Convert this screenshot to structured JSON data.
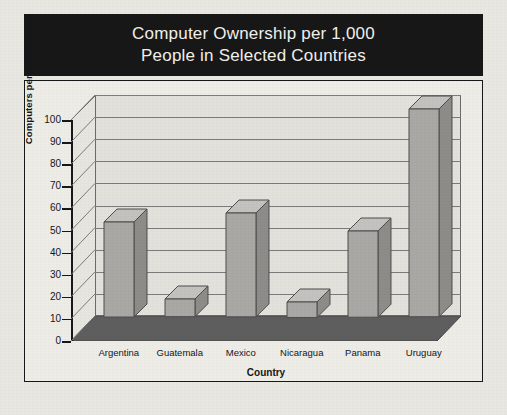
{
  "figure": {
    "title_line1": "Computer Ownership per 1,000",
    "title_line2": "People in Selected Countries",
    "title_bg": "#171717",
    "title_color": "#f2f0ec",
    "panel_bg": "#eeece7",
    "border_color": "#15171a"
  },
  "chart_data": {
    "type": "bar",
    "title": "Computer Ownership per 1,000 People in Selected Countries",
    "categories": [
      "Argentina",
      "Guatemala",
      "Mexico",
      "Nicaragua",
      "Panama",
      "Uruguay"
    ],
    "values": [
      43,
      8,
      47,
      7,
      39,
      94
    ],
    "xlabel": "Country",
    "ylabel": "Computers per 1,000 People",
    "ylim": [
      0,
      100
    ],
    "ytick_step": 10,
    "yticks": [
      100,
      90,
      80,
      70,
      60,
      50,
      40,
      30,
      20,
      10,
      0
    ],
    "ytick_labels": [
      "100",
      "90",
      "80",
      "70",
      "60",
      "50",
      "40",
      "30",
      "20",
      "10",
      "0"
    ],
    "grid": true,
    "grid_axis": "y",
    "legend": false,
    "style": "3d-column",
    "bar_color": "#a9a8a4",
    "bar_side_color": "#8d8c88",
    "bar_top_color": "#c3c2be",
    "bar_edge_color": "#4d4d4d",
    "wall_color": "#e3e1dc",
    "floor_color": "#5e5e5e",
    "gridline_color": "#7b7b7b"
  }
}
